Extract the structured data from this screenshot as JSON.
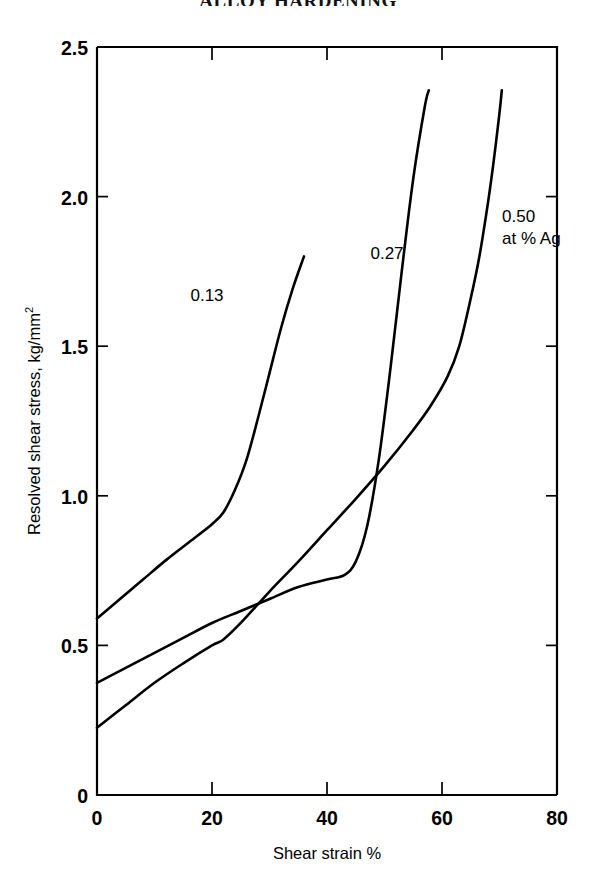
{
  "figure": {
    "title": "ALLOY HARDENING"
  },
  "chart_data": {
    "type": "line",
    "title": "ALLOY HARDENING",
    "xlabel": "Shear strain %",
    "ylabel": "Resolved shear stress, kg/mm",
    "ylabel_superscript": "2",
    "xlim": [
      0,
      80
    ],
    "ylim": [
      0,
      2.5
    ],
    "xticks": [
      0,
      20,
      40,
      60,
      80
    ],
    "yticks": [
      0,
      0.5,
      1.0,
      1.5,
      2.0,
      2.5
    ],
    "xtick_labels": [
      "0",
      "20",
      "40",
      "60",
      "80"
    ],
    "ytick_labels": [
      "0",
      "0.5",
      "1.0",
      "1.5",
      "2.0",
      "2.5"
    ],
    "grid": false,
    "legend_position": "inline-curve-labels",
    "legend_note": "at % Ag",
    "series": [
      {
        "name": "0.13",
        "label": "0.13",
        "label_x": 26.0,
        "label_y": 1.635,
        "x": [
          0,
          4,
          8,
          12,
          16,
          20,
          22,
          24,
          26,
          28,
          30,
          32,
          34,
          36
        ],
        "y": [
          0.59,
          0.655,
          0.72,
          0.785,
          0.845,
          0.905,
          0.945,
          1.02,
          1.12,
          1.26,
          1.41,
          1.56,
          1.69,
          1.8
        ]
      },
      {
        "name": "0.27",
        "label": "0.27",
        "label_x": 40.0,
        "label_y": 1.775,
        "x": [
          0,
          5,
          10,
          15,
          20,
          25,
          30,
          35,
          40,
          43,
          45,
          47,
          49,
          51,
          53,
          55,
          57,
          57.7
        ],
        "y": [
          0.375,
          0.425,
          0.475,
          0.525,
          0.575,
          0.615,
          0.655,
          0.695,
          0.72,
          0.735,
          0.78,
          0.9,
          1.12,
          1.42,
          1.75,
          2.06,
          2.3,
          2.355
        ]
      },
      {
        "name": "0.50",
        "label": "0.50",
        "label_x": 63.0,
        "label_y": 2.06,
        "sublabel": "at % Ag",
        "sublabel_x": 63.0,
        "sublabel_y": 1.92,
        "x": [
          0,
          5,
          10,
          15,
          20,
          22,
          25,
          30,
          35,
          40,
          45,
          50,
          55,
          58,
          61,
          63,
          65,
          66.5,
          68,
          69,
          70,
          70.4
        ],
        "y": [
          0.225,
          0.3,
          0.375,
          0.44,
          0.5,
          0.52,
          0.575,
          0.68,
          0.78,
          0.885,
          0.99,
          1.1,
          1.22,
          1.3,
          1.4,
          1.5,
          1.66,
          1.8,
          1.98,
          2.12,
          2.28,
          2.355
        ]
      }
    ],
    "colors": {
      "curve": "#000000",
      "axis": "#000000",
      "background": "#ffffff"
    }
  }
}
